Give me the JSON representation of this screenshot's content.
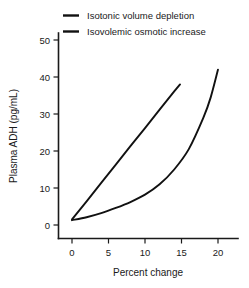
{
  "chart_data": {
    "type": "line",
    "title": "",
    "xlabel": "Percent change",
    "ylabel": "Plasma ADH (pg/mL)",
    "xlim": [
      -2,
      22.5
    ],
    "ylim": [
      -3,
      55
    ],
    "xticks": [
      0,
      5,
      10,
      15,
      20
    ],
    "xtick_labels": [
      "0",
      "5",
      "10",
      "15",
      "20"
    ],
    "yticks": [
      0,
      10,
      20,
      30,
      40,
      50
    ],
    "ytick_labels": [
      "0",
      "10",
      "20",
      "30",
      "40",
      "50"
    ],
    "grid": false,
    "legend_position": "top-left",
    "series": [
      {
        "name": "Isotonic volume depletion",
        "style": "straight",
        "color": "#111111",
        "x": [
          0,
          2,
          4,
          6,
          8,
          10,
          12,
          14,
          14.8
        ],
        "y": [
          1.5,
          6.4,
          11.4,
          16.3,
          21.3,
          26.2,
          31.2,
          36.1,
          38.0
        ]
      },
      {
        "name": "Isovolemic osmotic increase",
        "style": "exponential-curve",
        "color": "#111111",
        "x": [
          0,
          2,
          4,
          6,
          8,
          10,
          12,
          14,
          16,
          18,
          19,
          20
        ],
        "y": [
          1.3,
          2.1,
          3.2,
          4.6,
          6.2,
          8.2,
          11.0,
          15.0,
          20.5,
          29.0,
          34.5,
          42.0
        ]
      }
    ]
  },
  "legend": {
    "entries": [
      {
        "label": "Isotonic volume depletion"
      },
      {
        "label": "Isovolemic osmotic increase"
      }
    ]
  },
  "icons": {
    "legend_swatch": "horizontal-line-icon"
  }
}
